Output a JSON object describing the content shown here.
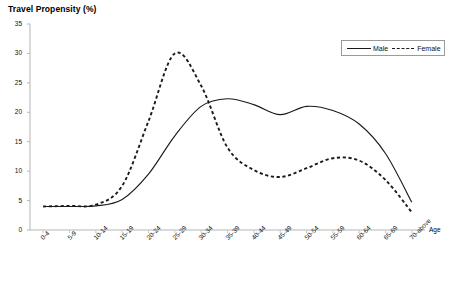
{
  "chart_data": {
    "type": "line",
    "title": "Travel Propensity (%)",
    "xlabel": "Age",
    "ylabel": "Travel Propensity (%)",
    "ylim": [
      0,
      35
    ],
    "ytick_step": 5,
    "yticks": [
      "35",
      "30",
      "25",
      "20",
      "15",
      "10",
      "5",
      "0"
    ],
    "grid": false,
    "legend_position": "top-right",
    "categories": [
      "0-4",
      "5-9",
      "10-14",
      "15-19",
      "20-24",
      "25-29",
      "30-34",
      "35-39",
      "40-44",
      "45-49",
      "50-54",
      "55-59",
      "60-64",
      "65-69",
      "70-above"
    ],
    "series": [
      {
        "name": "Male",
        "style": "solid",
        "color": "#1a1a1a",
        "values": [
          4.0,
          4.0,
          4.1,
          5.2,
          9.5,
          16.0,
          21.0,
          22.3,
          21.3,
          19.6,
          21.0,
          20.3,
          18.0,
          13.0,
          4.7
        ]
      },
      {
        "name": "Female",
        "style": "dashed",
        "color": "#1a1a1a",
        "values": [
          4.0,
          4.1,
          4.3,
          7.5,
          18.5,
          30.0,
          24.5,
          14.0,
          10.2,
          9.0,
          10.5,
          12.2,
          11.8,
          8.5,
          3.0
        ]
      }
    ]
  },
  "legend": {
    "male_label": "Male",
    "female_label": "Female"
  },
  "axes": {
    "x_axis_name": "Age"
  }
}
